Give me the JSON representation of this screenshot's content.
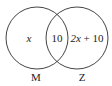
{
  "diagram": {
    "type": "venn",
    "colors": {
      "stroke": "#444444",
      "text": "#222222",
      "background": "#ffffff"
    },
    "sets": [
      {
        "name": "M",
        "label": "M"
      },
      {
        "name": "Z",
        "label": "Z"
      }
    ],
    "regions": {
      "m_only": {
        "var": "x",
        "text": ""
      },
      "intersection": {
        "text": "10"
      },
      "z_only": {
        "var": "2x",
        "rest": " + 10"
      }
    }
  }
}
